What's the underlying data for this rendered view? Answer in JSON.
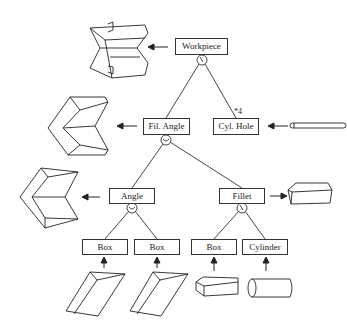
{
  "diagram": {
    "type": "feature-tree",
    "nodes": {
      "root": {
        "label": "Workpiece"
      },
      "fil_angle": {
        "label": "Fil. Angle"
      },
      "cyl_hole": {
        "label": "Cyl. Hole",
        "multiplicity": "*4"
      },
      "angle": {
        "label": "Angle"
      },
      "fillet": {
        "label": "Fillet"
      },
      "box1": {
        "label": "Box"
      },
      "box2": {
        "label": "Box"
      },
      "box3": {
        "label": "Box"
      },
      "cylinder": {
        "label": "Cylinder"
      }
    },
    "edges": [
      [
        "Workpiece",
        "Fil. Angle"
      ],
      [
        "Workpiece",
        "Cyl. Hole"
      ],
      [
        "Fil. Angle",
        "Angle"
      ],
      [
        "Fil. Angle",
        "Fillet"
      ],
      [
        "Angle",
        "Box"
      ],
      [
        "Angle",
        "Box"
      ],
      [
        "Fillet",
        "Box"
      ],
      [
        "Fillet",
        "Cylinder"
      ]
    ],
    "operators": {
      "workpiece": "subtraction",
      "fil_angle": "union",
      "angle": "union",
      "fillet": "subtraction"
    }
  }
}
